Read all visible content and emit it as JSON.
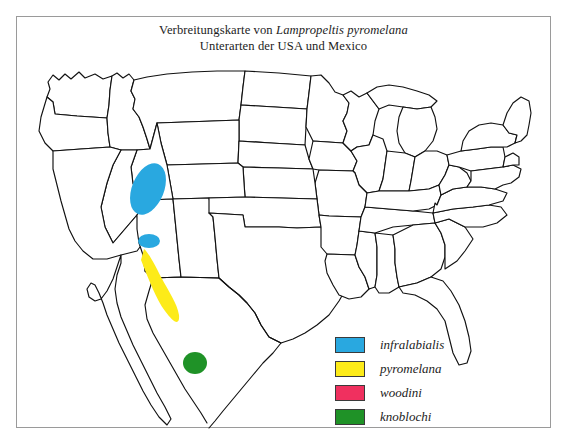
{
  "figure": {
    "title_line1_prefix": "Verbreitungskarte von ",
    "title_line1_species": "Lampropeltis pyromelana",
    "title_line2": "Unterarten der USA und Mexico",
    "scan_artifact_text": ""
  },
  "legend": {
    "items": [
      {
        "label": "infralabialis",
        "color": "#29a8e0",
        "swatch_name": "legend-swatch-infralabialis"
      },
      {
        "label": "pyromelana",
        "color": "#fdeb19",
        "swatch_name": "legend-swatch-pyromelana"
      },
      {
        "label": "woodini",
        "color": "#f0305f",
        "swatch_name": "legend-swatch-woodini"
      },
      {
        "label": "knoblochi",
        "color": "#1f9227",
        "swatch_name": "legend-swatch-knoblochi"
      }
    ]
  },
  "map": {
    "region": "United States and northern Mexico",
    "outline_color": "#111111",
    "land_fill": "#ffffff",
    "ranges": [
      {
        "subspecies": "infralabialis",
        "color": "#29a8e0",
        "shape": "ellipse",
        "area": "central Utah",
        "note": "large oval plus a small detached oval to the south"
      },
      {
        "subspecies": "pyromelana",
        "color": "#fdeb19",
        "shape": "elongated band",
        "area": "central Arizona into western New Mexico"
      },
      {
        "subspecies": "woodini",
        "color": "#f0305f",
        "shape": "elongated band",
        "area": "southeastern Arizona into Sonora, Mexico"
      },
      {
        "subspecies": "knoblochi",
        "color": "#1f9227",
        "shape": "small ellipse",
        "area": "Chihuahua, Mexico"
      }
    ]
  }
}
